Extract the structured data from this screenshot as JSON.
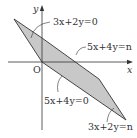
{
  "diagram": {
    "type": "region-on-coordinate-plane",
    "axes": {
      "x_label": "x",
      "y_label": "y",
      "origin_label": "O"
    },
    "region": {
      "shape": "parallelogram",
      "fill": "#c8c8c8",
      "stroke": "#333333",
      "vertices_px": [
        [
          14,
          19
        ],
        [
          42,
          62
        ],
        [
          126,
          120
        ],
        [
          99,
          79
        ]
      ]
    },
    "lines": [
      {
        "id": "top-left-edge",
        "label": "3x+2y=0"
      },
      {
        "id": "top-edge",
        "label": "5x+4y=n"
      },
      {
        "id": "bottom-edge",
        "label": "5x+4y=0"
      },
      {
        "id": "bottom-right-edge",
        "label": "3x+2y=n"
      }
    ]
  }
}
